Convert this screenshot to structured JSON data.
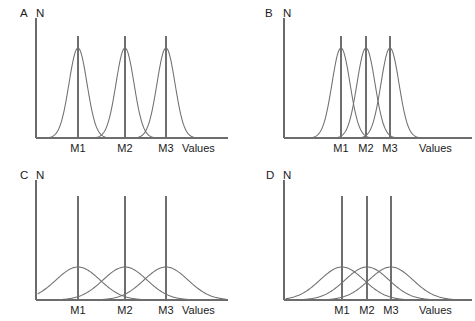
{
  "figure": {
    "title": "",
    "background_color": "#ffffff",
    "line_color": "#6f6f6f",
    "text_color": "#1b1b1b",
    "width": 475,
    "height": 321
  },
  "chart_data": {
    "type": "line",
    "title": "",
    "xlabel": "Values",
    "ylabel": "N",
    "grid": false,
    "legend": null,
    "panels": [
      {
        "letter": "A",
        "ylabel": "N",
        "xlabel": "Values",
        "tick_labels": [
          "M1",
          "M2",
          "M3"
        ],
        "means": [
          78,
          125,
          166
        ],
        "sigma": 9,
        "peak_height": 90,
        "mean_line_top": 36,
        "x_axis_y": 138,
        "y_axis_x": 36,
        "y_axis_top": 18,
        "x_axis_end": 228,
        "curve_start": 40,
        "curve_end": 225,
        "values_label_x": 182,
        "tick_label_y": 152,
        "letter_x": 20,
        "letter_y": 17,
        "ylabel_x": 36,
        "ylabel_y": 17,
        "spread": "narrow",
        "separation": "wide"
      },
      {
        "letter": "B",
        "ylabel": "N",
        "xlabel": "Values",
        "tick_labels": [
          "M1",
          "M2",
          "M3"
        ],
        "means": [
          103,
          128,
          152
        ],
        "sigma": 9,
        "peak_height": 90,
        "mean_line_top": 36,
        "x_axis_y": 138,
        "y_axis_x": 46,
        "y_axis_top": 18,
        "x_axis_end": 234,
        "curve_start": 50,
        "curve_end": 232,
        "values_label_x": 181,
        "tick_label_y": 152,
        "letter_x": 27,
        "letter_y": 17,
        "ylabel_x": 45,
        "ylabel_y": 17,
        "spread": "narrow",
        "separation": "narrow"
      },
      {
        "letter": "C",
        "ylabel": "N",
        "xlabel": "Values",
        "tick_labels": [
          "M1",
          "M2",
          "M3"
        ],
        "means": [
          78,
          125,
          166
        ],
        "sigma": 22,
        "peak_height": 33,
        "mean_line_top": 36,
        "x_axis_y": 140,
        "y_axis_x": 36,
        "y_axis_top": 20,
        "x_axis_end": 228,
        "curve_start": 38,
        "curve_end": 226,
        "values_label_x": 182,
        "tick_label_y": 154,
        "letter_x": 20,
        "letter_y": 19,
        "ylabel_x": 36,
        "ylabel_y": 19,
        "spread": "wide",
        "separation": "wide"
      },
      {
        "letter": "D",
        "ylabel": "N",
        "xlabel": "Values",
        "tick_labels": [
          "M1",
          "M2",
          "M3"
        ],
        "means": [
          104,
          129,
          153
        ],
        "sigma": 22,
        "peak_height": 33,
        "mean_line_top": 36,
        "x_axis_y": 140,
        "y_axis_x": 46,
        "y_axis_top": 20,
        "x_axis_end": 234,
        "curve_start": 48,
        "curve_end": 232,
        "values_label_x": 181,
        "tick_label_y": 154,
        "letter_x": 28,
        "letter_y": 19,
        "ylabel_x": 45,
        "ylabel_y": 19,
        "spread": "wide",
        "separation": "narrow"
      }
    ]
  }
}
